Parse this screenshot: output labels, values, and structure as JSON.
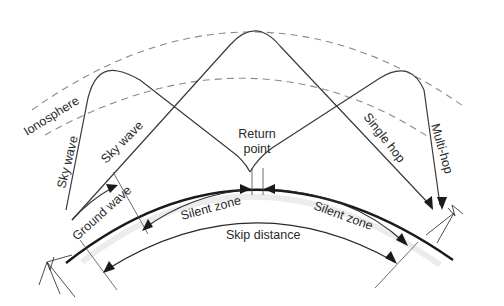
{
  "diagram": {
    "labels": {
      "ionosphere": "Ionosphere",
      "sky_wave_left": "Sky wave",
      "sky_wave_center": "Sky wave",
      "ground_wave": "Ground wave",
      "return_point_line1": "Return",
      "return_point_line2": "point",
      "single_hop": "Single hop",
      "multi_hop": "Multi-hop",
      "silent_zone_left": "Silent zone",
      "silent_zone_right": "Silent zone",
      "skip_distance": "Skip distance"
    },
    "colors": {
      "ray": "#3a3a3a",
      "earth": "#1a1a1a",
      "ionosphere": "#8a8a8a",
      "text": "#2a2a2a",
      "background": "#ffffff"
    }
  }
}
